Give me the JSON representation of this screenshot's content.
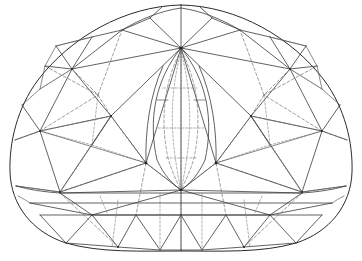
{
  "document": {
    "title": "Gemstone Facet Diagram",
    "subject": "trilliant-cut gemstone",
    "view": "face-up plan view",
    "background_color": "#ffffff",
    "symmetry": "bilateral about vertical center axis"
  },
  "canvas": {
    "width": 362,
    "height": 261
  },
  "style": {
    "outline_color": "#2b2b2b",
    "solid_line_color": "#3a3a3a",
    "hidden_line_color": "#6a6a6a",
    "node_color": "#262626",
    "outline_width": 1,
    "solid_width": 0.8,
    "hidden_width": 0.65,
    "hidden_dash": "3 2.2"
  },
  "geometry": {
    "center_axis_x": 181,
    "apex": {
      "x": 181,
      "y": 5
    },
    "crown_convergence": {
      "x": 181,
      "y": 48
    },
    "culet": {
      "x": 181,
      "y": 190
    },
    "left_extreme": {
      "x": 10,
      "y": 176
    },
    "right_extreme": {
      "x": 352,
      "y": 176
    },
    "bottom_center": {
      "x": 181,
      "y": 251
    },
    "outline_path": "M181,5 C238,6 292,38 324,80 C345,108 353,143 352,172 C351,205 330,232 296,243 C262,253 220,251 181,251 C142,251 100,253 66,243 C32,232 11,205 10,172 C9,143 17,108 38,80 C70,38 124,6 181,5 Z",
    "girdle_lines_y": [
      193,
      203,
      215
    ],
    "key_nodes": [
      {
        "x": 181,
        "y": 48,
        "label": "crown-apex-node"
      },
      {
        "x": 146,
        "y": 163,
        "label": "left-pavilion-node"
      },
      {
        "x": 216,
        "y": 163,
        "label": "right-pavilion-node"
      },
      {
        "x": 181,
        "y": 190,
        "label": "culet-node"
      },
      {
        "x": 181,
        "y": 160,
        "label": "keel-node"
      },
      {
        "x": 111,
        "y": 116,
        "label": "left-mid-node"
      },
      {
        "x": 251,
        "y": 116,
        "label": "right-mid-node"
      },
      {
        "x": 72,
        "y": 69,
        "label": "left-upper-node"
      },
      {
        "x": 290,
        "y": 69,
        "label": "right-upper-node"
      },
      {
        "x": 40,
        "y": 131,
        "label": "left-lower-node"
      },
      {
        "x": 322,
        "y": 131,
        "label": "right-lower-node"
      },
      {
        "x": 60,
        "y": 192,
        "label": "left-girdle-node"
      },
      {
        "x": 302,
        "y": 192,
        "label": "right-girdle-node"
      }
    ]
  },
  "facet_groups": [
    {
      "name": "table-facet",
      "style": "solid",
      "count": 1
    },
    {
      "name": "crown-star-facets",
      "style": "solid",
      "count": 6
    },
    {
      "name": "crown-main-facets",
      "style": "solid",
      "count": 6
    },
    {
      "name": "upper-girdle-facets",
      "style": "solid",
      "count": 12
    },
    {
      "name": "pavilion-main-facets",
      "style": "hidden",
      "count": 6
    },
    {
      "name": "lower-girdle-facets",
      "style": "hidden",
      "count": 12
    },
    {
      "name": "central-marquise-facets",
      "style": "mixed",
      "count": 8
    },
    {
      "name": "girdle-band",
      "style": "solid",
      "count": 3
    }
  ]
}
